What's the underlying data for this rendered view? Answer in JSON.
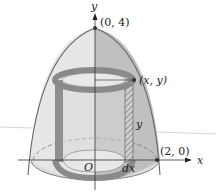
{
  "figure": {
    "colors": {
      "background": "#ffffff",
      "solid_light": "#e2e2e2",
      "solid_dark": "#b9b9b9",
      "shell": "#8f8f8f",
      "outline": "#555555",
      "axis": "#333333"
    },
    "labels": {
      "y_axis": "y",
      "x_axis": "x",
      "apex": "(0, 4)",
      "base_point": "(2, 0)",
      "curve_point": "(x, y)",
      "height": "y",
      "thickness": "dx",
      "origin": "O"
    }
  }
}
